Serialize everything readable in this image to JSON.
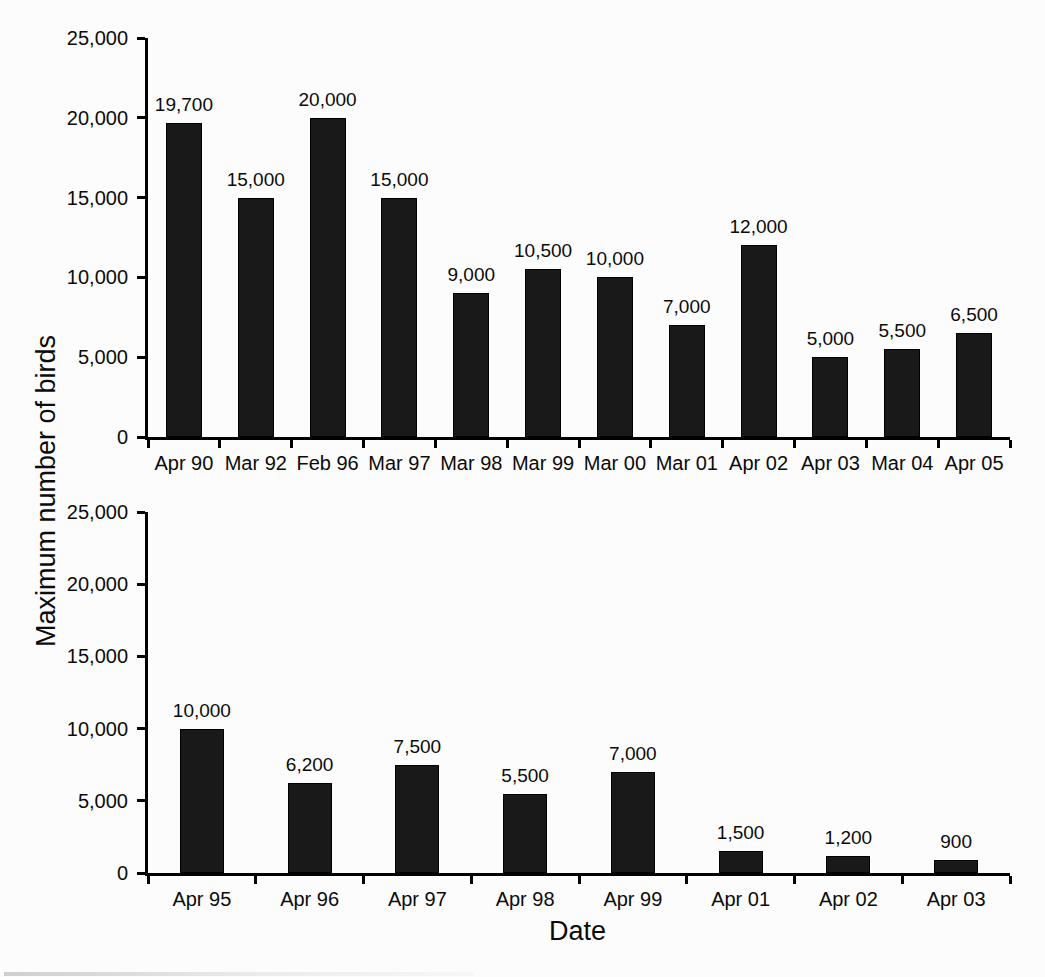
{
  "figure": {
    "ylabel": "Maximum number of birds",
    "xlabel": "Date",
    "background": "#fcfcfc",
    "bar_color": "#191919",
    "axis_color": "#000000",
    "grid": "off",
    "legend": "none"
  },
  "chart_data": [
    {
      "type": "bar",
      "position": "top",
      "categories": [
        "Apr 90",
        "Mar 92",
        "Feb 96",
        "Mar 97",
        "Mar 98",
        "Mar 99",
        "Mar 00",
        "Mar 01",
        "Apr 02",
        "Apr 03",
        "Mar 04",
        "Apr 05"
      ],
      "values": [
        19700,
        15000,
        20000,
        15000,
        9000,
        10500,
        10000,
        7000,
        12000,
        5000,
        5500,
        6500
      ],
      "value_labels": [
        "19,700",
        "15,000",
        "20,000",
        "15,000",
        "9,000",
        "10,500",
        "10,000",
        "7,000",
        "12,000",
        "5,000",
        "5,500",
        "6,500"
      ],
      "ylim": [
        0,
        25000
      ],
      "ytick_step": 5000,
      "ytick_labels": [
        "0",
        "5,000",
        "10,000",
        "15,000",
        "20,000",
        "25,000"
      ],
      "xlabel": "Date",
      "ylabel": "Maximum number of birds"
    },
    {
      "type": "bar",
      "position": "bottom",
      "categories": [
        "Apr 95",
        "Apr 96",
        "Apr 97",
        "Apr 98",
        "Apr 99",
        "Apr 01",
        "Apr 02",
        "Apr 03"
      ],
      "values": [
        10000,
        6200,
        7500,
        5500,
        7000,
        1500,
        1200,
        900
      ],
      "value_labels": [
        "10,000",
        "6,200",
        "7,500",
        "5,500",
        "7,000",
        "1,500",
        "1,200",
        "900"
      ],
      "ylim": [
        0,
        25000
      ],
      "ytick_step": 5000,
      "ytick_labels": [
        "0",
        "5,000",
        "10,000",
        "15,000",
        "20,000",
        "25,000"
      ],
      "xlabel": "Date",
      "ylabel": "Maximum number of birds"
    }
  ]
}
